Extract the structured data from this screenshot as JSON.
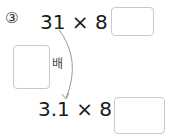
{
  "problem": {
    "number_marker": "③",
    "equation_top": {
      "left": "31 × 8 =",
      "answer": ""
    },
    "factor": {
      "answer": "",
      "suffix": "배"
    },
    "equation_bottom": {
      "left": "3.1 × 8 =",
      "answer": ""
    }
  },
  "colors": {
    "text": "#1a1a1a",
    "box_border": "#c9c9c9",
    "arrow": "#9a9a9a"
  }
}
